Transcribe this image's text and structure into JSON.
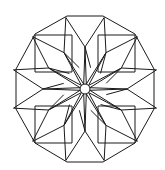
{
  "figure": {
    "type": "geometric-rosette",
    "stroke_color": "#1a1a1a",
    "background": "#ffffff",
    "center": [
      85,
      89
    ],
    "outer_polygon_sides": 12,
    "center_circle_radius": 5
  }
}
